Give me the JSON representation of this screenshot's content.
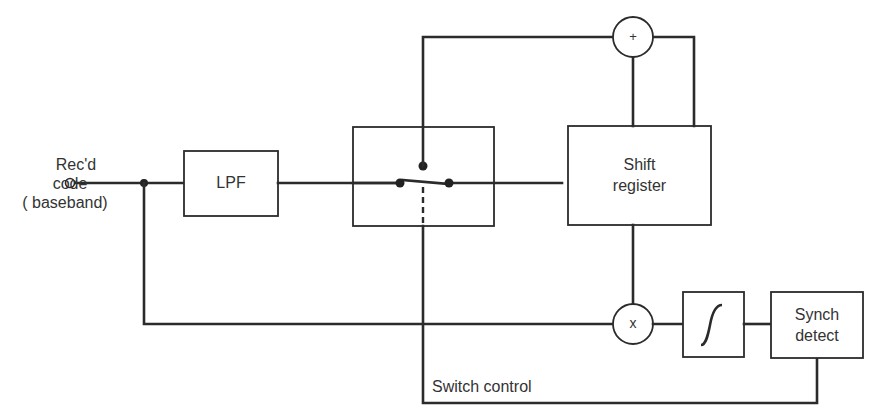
{
  "diagram": {
    "type": "block-diagram",
    "input": {
      "label_lines": [
        "Rec'd",
        "code",
        "( baseband)"
      ]
    },
    "blocks": [
      {
        "id": "lpf",
        "label": "LPF"
      },
      {
        "id": "switch",
        "label": ""
      },
      {
        "id": "shift_register",
        "label_lines": [
          "Shift",
          "register"
        ]
      },
      {
        "id": "adder",
        "symbol": "+"
      },
      {
        "id": "multiplier",
        "symbol": "x"
      },
      {
        "id": "integrator",
        "symbol": "∫"
      },
      {
        "id": "synch_detect",
        "label_lines": [
          "Synch",
          "detect"
        ]
      }
    ],
    "signals": {
      "switch_control_label": "Switch control"
    },
    "edges": [
      [
        "input",
        "lpf"
      ],
      [
        "lpf",
        "switch"
      ],
      [
        "switch",
        "shift_register"
      ],
      [
        "shift_register",
        "adder"
      ],
      [
        "adder",
        "switch"
      ],
      [
        "shift_register",
        "multiplier"
      ],
      [
        "input",
        "multiplier"
      ],
      [
        "multiplier",
        "integrator"
      ],
      [
        "integrator",
        "synch_detect"
      ],
      [
        "synch_detect",
        "switch"
      ]
    ]
  },
  "colors": {
    "line": "#2b2b2b",
    "background": "#ffffff"
  }
}
